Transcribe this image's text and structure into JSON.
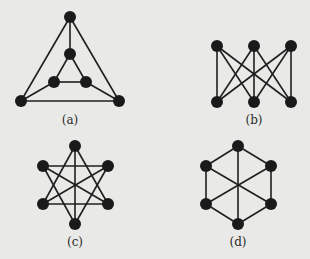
{
  "colors": {
    "background": "#e9e9e7",
    "node": "#1a1a1a",
    "edge": "#1f1f1f"
  },
  "graphs": [
    {
      "id": "a",
      "label": "(a)",
      "label_pos": [
        70,
        113
      ],
      "nodes": [
        [
          70,
          17
        ],
        [
          70,
          54
        ],
        [
          54,
          82
        ],
        [
          86,
          82
        ],
        [
          21,
          101
        ],
        [
          119,
          101
        ]
      ],
      "edges": [
        [
          0,
          1
        ],
        [
          0,
          4
        ],
        [
          0,
          5
        ],
        [
          1,
          2
        ],
        [
          1,
          3
        ],
        [
          2,
          3
        ],
        [
          2,
          4
        ],
        [
          3,
          5
        ],
        [
          4,
          5
        ]
      ]
    },
    {
      "id": "b",
      "label": "(b)",
      "label_pos": [
        254,
        113
      ],
      "nodes": [
        [
          217,
          46
        ],
        [
          254,
          46
        ],
        [
          291,
          46
        ],
        [
          217,
          102
        ],
        [
          254,
          102
        ],
        [
          291,
          102
        ]
      ],
      "edges": [
        [
          0,
          3
        ],
        [
          0,
          4
        ],
        [
          0,
          5
        ],
        [
          1,
          3
        ],
        [
          1,
          4
        ],
        [
          1,
          5
        ],
        [
          2,
          3
        ],
        [
          2,
          4
        ],
        [
          2,
          5
        ]
      ]
    },
    {
      "id": "c",
      "label": "(c)",
      "label_pos": [
        75,
        235
      ],
      "nodes": [
        [
          75,
          146
        ],
        [
          43,
          166
        ],
        [
          108,
          166
        ],
        [
          43,
          204
        ],
        [
          108,
          204
        ],
        [
          75,
          224
        ]
      ],
      "edges": [
        [
          1,
          2
        ],
        [
          3,
          4
        ],
        [
          0,
          5
        ],
        [
          0,
          3
        ],
        [
          0,
          4
        ],
        [
          5,
          1
        ],
        [
          5,
          2
        ],
        [
          1,
          4
        ],
        [
          2,
          3
        ]
      ]
    },
    {
      "id": "d",
      "label": "(d)",
      "label_pos": [
        238,
        235
      ],
      "nodes": [
        [
          238,
          146
        ],
        [
          206,
          166
        ],
        [
          271,
          166
        ],
        [
          206,
          204
        ],
        [
          271,
          204
        ],
        [
          238,
          224
        ]
      ],
      "edges": [
        [
          0,
          1
        ],
        [
          0,
          2
        ],
        [
          1,
          3
        ],
        [
          2,
          4
        ],
        [
          3,
          5
        ],
        [
          4,
          5
        ],
        [
          0,
          5
        ],
        [
          1,
          4
        ],
        [
          2,
          3
        ]
      ]
    }
  ]
}
